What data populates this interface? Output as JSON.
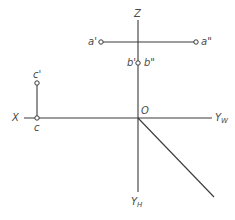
{
  "diagram": {
    "type": "orthographic-projection-three-view",
    "colors": {
      "background": "#ffffff",
      "line": "#3a3a3a",
      "label": "#4a4a4a"
    },
    "origin": {
      "label": "O",
      "x": 138,
      "y": 118
    },
    "axes": {
      "z": {
        "label": "Z",
        "from": [
          138,
          20
        ],
        "to": [
          138,
          118
        ]
      },
      "x": {
        "label": "X",
        "from": [
          24,
          118
        ],
        "to": [
          138,
          118
        ]
      },
      "yw": {
        "label": "Y",
        "sub": "W",
        "from": [
          138,
          118
        ],
        "to": [
          212,
          118
        ]
      },
      "yh": {
        "label": "Y",
        "sub": "H",
        "from": [
          138,
          118
        ],
        "to": [
          138,
          192
        ]
      },
      "diagonal": {
        "from": [
          138,
          118
        ],
        "to": [
          214,
          197
        ]
      }
    },
    "points": [
      {
        "id": "a-front",
        "label": "a'",
        "x": 101,
        "y": 42
      },
      {
        "id": "a-side",
        "label": "a\"",
        "x": 196,
        "y": 42
      },
      {
        "id": "b-front-side",
        "label_left": "b'",
        "label_right": "b\"",
        "x": 138,
        "y": 63
      },
      {
        "id": "c-front",
        "label": "c'",
        "x": 37,
        "y": 83
      },
      {
        "id": "c-top",
        "label": "c",
        "x": 37,
        "y": 118
      }
    ],
    "lines": [
      {
        "id": "a-projection-line",
        "from": [
          101,
          42
        ],
        "to": [
          196,
          42
        ]
      },
      {
        "id": "c-projection-line",
        "from": [
          37,
          83
        ],
        "to": [
          37,
          118
        ]
      }
    ]
  }
}
